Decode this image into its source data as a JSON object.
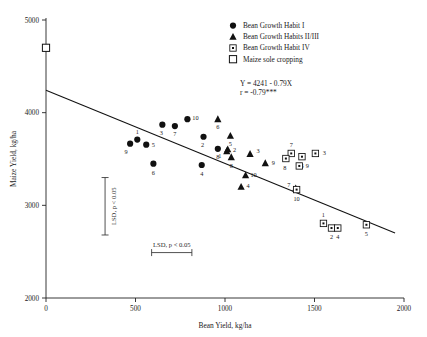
{
  "chart_data": {
    "type": "scatter",
    "title": "",
    "xlabel": "Bean Yield, kg/ha",
    "ylabel": "Maize Yield, kg/ha",
    "xlim": [
      0,
      2000
    ],
    "ylim": [
      2000,
      5000
    ],
    "xticks": [
      "0",
      "500",
      "1000",
      "1500",
      "2000"
    ],
    "yticks": [
      "2000",
      "3000",
      "4000",
      "5000"
    ],
    "grid": false,
    "legend_position": "top-right",
    "regression": {
      "equation": "Y = 4241 - 0.79X",
      "correlation": "r  = -0.79***",
      "intercept": 4241,
      "slope": -0.79,
      "x_start": 0,
      "x_end": 1950
    },
    "legend": [
      {
        "label": "Bean Growth Habit I",
        "marker": "filled-circle"
      },
      {
        "label": "Bean Growth Habits II/III",
        "marker": "filled-triangle"
      },
      {
        "label": "Bean Growth Habit IV",
        "marker": "dotted-square"
      },
      {
        "label": "Maize sole cropping",
        "marker": "open-square"
      }
    ],
    "series": [
      {
        "name": "Bean Growth Habit I",
        "marker": "filled-circle",
        "points": [
          {
            "label": "9",
            "x": 470,
            "y": 3665,
            "lx": -4,
            "ly": 10
          },
          {
            "label": "1",
            "x": 510,
            "y": 3710,
            "lx": 0,
            "ly": -6
          },
          {
            "label": "5",
            "x": 560,
            "y": 3655,
            "lx": 7,
            "ly": 2
          },
          {
            "label": "3",
            "x": 650,
            "y": 3870,
            "lx": -1,
            "ly": 10
          },
          {
            "label": "7",
            "x": 720,
            "y": 3855,
            "lx": 0,
            "ly": 10
          },
          {
            "label": "10",
            "x": 790,
            "y": 3930,
            "lx": 8,
            "ly": 1
          },
          {
            "label": "6",
            "x": 600,
            "y": 3450,
            "lx": 0,
            "ly": 11
          },
          {
            "label": "2",
            "x": 880,
            "y": 3740,
            "lx": -1,
            "ly": 10
          },
          {
            "label": "8",
            "x": 960,
            "y": 3610,
            "lx": 0,
            "ly": 10
          },
          {
            "label": "4",
            "x": 870,
            "y": 3435,
            "lx": 0,
            "ly": 11
          }
        ]
      },
      {
        "name": "Bean Growth Habits II/III",
        "marker": "filled-triangle",
        "points": [
          {
            "label": "6",
            "x": 960,
            "y": 3930,
            "lx": 0,
            "ly": 10
          },
          {
            "label": "5",
            "x": 1030,
            "y": 3750,
            "lx": 0,
            "ly": 10
          },
          {
            "label": "2",
            "x": 1015,
            "y": 3605,
            "lx": 7,
            "ly": 3
          },
          {
            "label": "1",
            "x": 1010,
            "y": 3585,
            "lx": -7,
            "ly": 7
          },
          {
            "label": "8",
            "x": 1035,
            "y": 3520,
            "lx": 0,
            "ly": 11
          },
          {
            "label": "3",
            "x": 1140,
            "y": 3555,
            "lx": 8,
            "ly": -1
          },
          {
            "label": "9",
            "x": 1225,
            "y": 3455,
            "lx": 8,
            "ly": 2
          },
          {
            "label": "10",
            "x": 1115,
            "y": 3325,
            "lx": 8,
            "ly": 2
          },
          {
            "label": "4",
            "x": 1090,
            "y": 3200,
            "lx": 7,
            "ly": 1
          },
          {
            "label": "7",
            "x": 1395,
            "y": 3185,
            "lx": -7,
            "ly": -1
          }
        ]
      },
      {
        "name": "Bean Growth Habit IV",
        "marker": "dotted-square",
        "points": [
          {
            "label": "7",
            "x": 1370,
            "y": 3560,
            "lx": 0,
            "ly": -6
          },
          {
            "label": "8",
            "x": 1340,
            "y": 3505,
            "lx": -1,
            "ly": 11
          },
          {
            "label": "6",
            "x": 1430,
            "y": 3525,
            "lx": 0,
            "ly": 11
          },
          {
            "label": "3",
            "x": 1505,
            "y": 3560,
            "lx": 9,
            "ly": 2
          },
          {
            "label": "9",
            "x": 1415,
            "y": 3425,
            "lx": 8,
            "ly": 2
          },
          {
            "label": "10",
            "x": 1400,
            "y": 3170,
            "lx": 0,
            "ly": 11
          },
          {
            "label": "1",
            "x": 1550,
            "y": 2805,
            "lx": 0,
            "ly": -6
          },
          {
            "label": "2",
            "x": 1595,
            "y": 2755,
            "lx": 0,
            "ly": 11
          },
          {
            "label": "4",
            "x": 1630,
            "y": 2755,
            "lx": 0,
            "ly": 11
          },
          {
            "label": "5",
            "x": 1790,
            "y": 2790,
            "lx": 0,
            "ly": 11
          }
        ]
      },
      {
        "name": "Maize sole cropping",
        "marker": "open-square",
        "points": [
          {
            "label": "",
            "x": 0,
            "y": 4700,
            "lx": 0,
            "ly": 0
          }
        ]
      }
    ],
    "annotations": [
      {
        "name": "lsd-vertical",
        "text": "LSD, p < 0.05",
        "orientation": "vertical",
        "x": 330,
        "y_low": 2680,
        "y_high": 3300
      },
      {
        "name": "lsd-horizontal",
        "text": "LSD, p < 0.05",
        "orientation": "horizontal",
        "y": 2490,
        "x_low": 590,
        "x_high": 815
      }
    ]
  }
}
